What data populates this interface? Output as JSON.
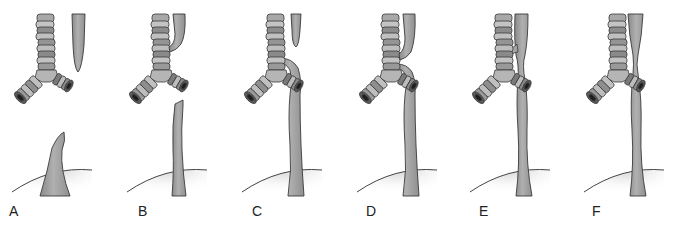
{
  "figure": {
    "colors": {
      "esophagus_fill": "#9e9e9e",
      "esophagus_light": "#bdbdbd",
      "ring_light": "#b8b8b8",
      "ring_dark": "#7d7d7d",
      "outline": "#3a3a3a",
      "stomach_shade": "#d9d9d9"
    },
    "panels": [
      {
        "label": "A",
        "x": 0,
        "type": "atresia-no-fistula"
      },
      {
        "label": "B",
        "x": 115,
        "type": "atresia-proximal-fistula"
      },
      {
        "label": "C",
        "x": 230,
        "type": "atresia-distal-fistula"
      },
      {
        "label": "D",
        "x": 345,
        "type": "atresia-double-fistula"
      },
      {
        "label": "E",
        "x": 458,
        "type": "h-type-fistula"
      },
      {
        "label": "F",
        "x": 572,
        "type": "stenosis"
      }
    ]
  }
}
